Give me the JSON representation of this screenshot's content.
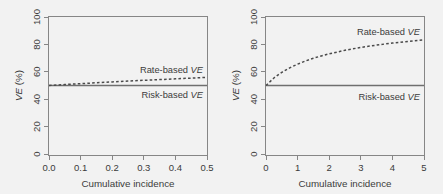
{
  "figure": {
    "background_color": "#f2f2f2",
    "axis_color": "#868686",
    "text_color": "#3b3b3b"
  },
  "chart_data": [
    {
      "type": "line",
      "panel": "left",
      "title": "",
      "xlabel": "Cumulative incidence",
      "ylabel": "VE (%)",
      "xlim": [
        0.0,
        0.5
      ],
      "ylim": [
        0,
        100
      ],
      "xticks": [
        0.0,
        0.1,
        0.2,
        0.3,
        0.4,
        0.5
      ],
      "xtick_labels": [
        "0.0",
        "0.1",
        "0.2",
        "0.3",
        "0.4",
        "0.5"
      ],
      "yticks": [
        0,
        20,
        40,
        60,
        80,
        100
      ],
      "ytick_labels": [
        "0",
        "20",
        "40",
        "60",
        "80",
        "100"
      ],
      "grid": false,
      "legend": "inline-annotations",
      "series": [
        {
          "name": "Rate-based VE",
          "style": "dashed",
          "color": "#4a4a4a",
          "x": [
            0.0,
            0.05,
            0.1,
            0.15,
            0.2,
            0.25,
            0.3,
            0.35,
            0.4,
            0.45,
            0.5
          ],
          "values": [
            50.0,
            50.7,
            51.3,
            52.0,
            52.6,
            53.2,
            53.8,
            54.3,
            54.9,
            55.4,
            56.0
          ]
        },
        {
          "name": "Risk-based VE",
          "style": "solid",
          "color": "#6f6f6f",
          "x": [
            0.0,
            0.1,
            0.2,
            0.3,
            0.4,
            0.5
          ],
          "values": [
            50,
            50,
            50,
            50,
            50,
            50
          ]
        }
      ],
      "annotations": [
        {
          "text": "Rate-based VE",
          "italic_suffix": "VE",
          "x": 0.34,
          "y": 62
        },
        {
          "text": "Risk-based VE",
          "italic_suffix": "VE",
          "x": 0.34,
          "y": 44
        }
      ]
    },
    {
      "type": "line",
      "panel": "right",
      "title": "",
      "xlabel": "Cumulative incidence",
      "ylabel": "VE (%)",
      "xlim": [
        0,
        5
      ],
      "ylim": [
        0,
        100
      ],
      "xticks": [
        0,
        1,
        2,
        3,
        4,
        5
      ],
      "xtick_labels": [
        "0",
        "1",
        "2",
        "3",
        "4",
        "5"
      ],
      "yticks": [
        0,
        20,
        40,
        60,
        80,
        100
      ],
      "ytick_labels": [
        "0",
        "20",
        "40",
        "60",
        "80",
        "100"
      ],
      "grid": false,
      "legend": "inline-annotations",
      "series": [
        {
          "name": "Rate-based VE",
          "style": "dashed",
          "color": "#4a4a4a",
          "x": [
            0.0,
            0.25,
            0.5,
            0.75,
            1.0,
            1.25,
            1.5,
            1.75,
            2.0,
            2.5,
            3.0,
            3.5,
            4.0,
            4.5,
            5.0
          ],
          "values": [
            50.0,
            55.5,
            59.6,
            62.9,
            65.6,
            67.9,
            69.9,
            71.6,
            73.1,
            75.7,
            77.8,
            79.5,
            81.0,
            82.2,
            83.3
          ]
        },
        {
          "name": "Risk-based VE",
          "style": "solid",
          "color": "#6f6f6f",
          "x": [
            0,
            1,
            2,
            3,
            4,
            5
          ],
          "values": [
            50,
            50,
            50,
            50,
            50,
            50
          ]
        }
      ],
      "annotations": [
        {
          "text": "Rate-based VE",
          "italic_suffix": "VE",
          "x": 3.3,
          "y": 88
        },
        {
          "text": "Risk-based VE",
          "italic_suffix": "VE",
          "x": 3.3,
          "y": 43
        }
      ]
    }
  ],
  "panels": {
    "left": {
      "xlabel": "Cumulative incidence",
      "ylabel_prefix": "VE",
      "ylabel_suffix": " (%)",
      "xtick_labels": [
        "0.0",
        "0.1",
        "0.2",
        "0.3",
        "0.4",
        "0.5"
      ],
      "ytick_labels": [
        "0",
        "20",
        "40",
        "60",
        "80",
        "100"
      ],
      "label_rate_prefix": "Rate-based ",
      "label_rate_ve": "VE",
      "label_risk_prefix": "Risk-based ",
      "label_risk_ve": "VE"
    },
    "right": {
      "xlabel": "Cumulative incidence",
      "ylabel_prefix": "VE",
      "ylabel_suffix": " (%)",
      "xtick_labels": [
        "0",
        "1",
        "2",
        "3",
        "4",
        "5"
      ],
      "ytick_labels": [
        "0",
        "20",
        "40",
        "60",
        "80",
        "100"
      ],
      "label_rate_prefix": "Rate-based ",
      "label_rate_ve": "VE",
      "label_risk_prefix": "Risk-based ",
      "label_risk_ve": "VE"
    }
  }
}
